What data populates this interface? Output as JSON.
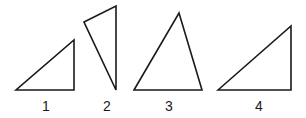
{
  "diagram": {
    "stroke_color": "#1a1a1a",
    "triangles": [
      {
        "label": "1",
        "points": "16,90 74,90 74,40",
        "label_x": 46,
        "label_y": 99
      },
      {
        "label": "2",
        "points": "84,22 116,6 116,90",
        "label_x": 107,
        "label_y": 99
      },
      {
        "label": "3",
        "points": "134,90 179,13 202,90",
        "label_x": 169,
        "label_y": 99
      },
      {
        "label": "4",
        "points": "218,90 291,26 291,90",
        "label_x": 259,
        "label_y": 99
      }
    ]
  }
}
